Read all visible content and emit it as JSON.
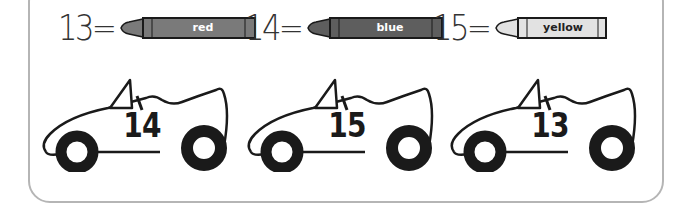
{
  "key": {
    "items": [
      {
        "number": "13",
        "equals": "=",
        "color_name": "red",
        "fill": "#7a7a7a",
        "text_color": "#ffffff"
      },
      {
        "number": "14",
        "equals": "=",
        "color_name": "blue",
        "fill": "#5e5e5e",
        "text_color": "#ffffff"
      },
      {
        "number": "15",
        "equals": "=",
        "color_name": "yellow",
        "fill": "#e2e2e2",
        "text_color": "#222222"
      }
    ]
  },
  "cars": [
    {
      "number": "14"
    },
    {
      "number": "15"
    },
    {
      "number": "13"
    }
  ],
  "colors": {
    "outline": "#1a1a1a",
    "frame_border": "#b5b5b5",
    "background": "#ffffff"
  }
}
